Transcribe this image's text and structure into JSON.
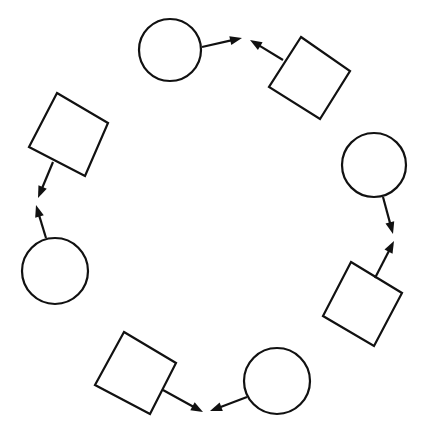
{
  "diagram": {
    "width": 424,
    "height": 432,
    "background": "#ffffff",
    "stroke_color": "#111111",
    "circles": [
      {
        "id": "circle-top",
        "cx": 170,
        "cy": 50,
        "r": 31
      },
      {
        "id": "circle-left",
        "cx": 55,
        "cy": 271,
        "r": 33
      },
      {
        "id": "circle-right",
        "cx": 374,
        "cy": 165,
        "r": 32
      },
      {
        "id": "circle-bottom",
        "cx": 277,
        "cy": 381,
        "r": 33
      }
    ],
    "squares": [
      {
        "id": "square-top-right",
        "points": "301,37 350,71 320,119 269,87"
      },
      {
        "id": "square-top-left",
        "points": "57,93 108,123 85,176 29,147"
      },
      {
        "id": "square-right",
        "points": "351,262 402,293 374,346 323,316"
      },
      {
        "id": "square-bottom-left",
        "points": "124,332 176,363 150,414 95,385"
      }
    ],
    "arrows": [
      {
        "id": "arrow-circle-top-to-meet",
        "from": [
          202,
          47
        ],
        "to": [
          242,
          38
        ]
      },
      {
        "id": "arrow-square-top-right-to-meet",
        "from": [
          283,
          60
        ],
        "to": [
          250,
          40
        ]
      },
      {
        "id": "arrow-square-top-left-to-meet",
        "from": [
          53,
          162
        ],
        "to": [
          38,
          198
        ]
      },
      {
        "id": "arrow-circle-left-to-meet",
        "from": [
          46,
          238
        ],
        "to": [
          36,
          205
        ]
      },
      {
        "id": "arrow-circle-right-to-meet",
        "from": [
          383,
          197
        ],
        "to": [
          393,
          234
        ]
      },
      {
        "id": "arrow-square-right-to-meet",
        "from": [
          375,
          278
        ],
        "to": [
          394,
          241
        ]
      },
      {
        "id": "arrow-square-bottom-left-to-meet",
        "from": [
          163,
          390
        ],
        "to": [
          203,
          412
        ]
      },
      {
        "id": "arrow-circle-bottom-to-meet",
        "from": [
          247,
          397
        ],
        "to": [
          210,
          411
        ]
      }
    ]
  }
}
